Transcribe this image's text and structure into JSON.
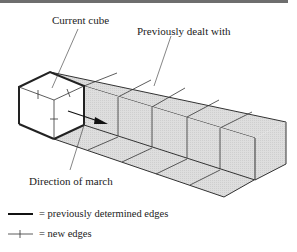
{
  "diagram": {
    "type": "marching-cubes-illustration",
    "labels": {
      "current_cube": "Current cube",
      "previously_dealt_with": "Previously dealt with",
      "direction_of_march": "Direction of march"
    },
    "legend": [
      {
        "symbol": "thick-line",
        "text": "= previously determined edges"
      },
      {
        "symbol": "line-with-tick",
        "text": "= new edges"
      }
    ],
    "colors": {
      "shaded_fill": "#d9d9d9",
      "current_cube_fill": "#ffffff",
      "line": "#333333",
      "top_rule": "#6e6e6e"
    },
    "grey_cubes_count": 5
  }
}
